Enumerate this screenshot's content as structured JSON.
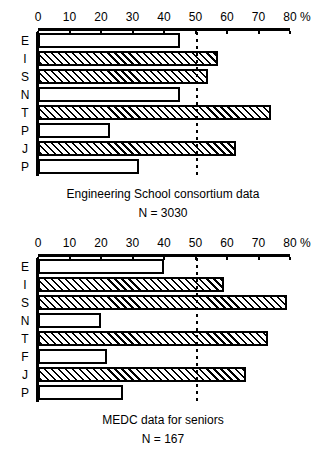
{
  "chart_data": [
    {
      "type": "bar",
      "orientation": "horizontal",
      "title": "Engineering School consortium data",
      "subtitle": "N = 3030",
      "xlabel": "%",
      "ylabel": "",
      "xlim": [
        0,
        80
      ],
      "xticks": [
        0,
        10,
        20,
        30,
        40,
        50,
        60,
        70,
        80
      ],
      "xtick_labels": [
        "0",
        "10",
        "20",
        "30",
        "40",
        "50",
        "60",
        "70",
        "80"
      ],
      "unit_suffix": "%",
      "grid": false,
      "reference_line": 50,
      "legend": "none",
      "categories": [
        "E",
        "I",
        "S",
        "N",
        "T",
        "P",
        "J",
        "P"
      ],
      "values": [
        45,
        57,
        54,
        45,
        74,
        23,
        63,
        32
      ],
      "fills": [
        "plain",
        "hatched",
        "hatched",
        "plain",
        "hatched",
        "plain",
        "hatched",
        "plain"
      ]
    },
    {
      "type": "bar",
      "orientation": "horizontal",
      "title": "MEDC data for seniors",
      "subtitle": "N = 167",
      "xlabel": "%",
      "ylabel": "",
      "xlim": [
        0,
        80
      ],
      "xticks": [
        0,
        10,
        20,
        30,
        40,
        50,
        60,
        70,
        80
      ],
      "xtick_labels": [
        "0",
        "10",
        "20",
        "30",
        "40",
        "50",
        "60",
        "70",
        "80"
      ],
      "unit_suffix": "%",
      "grid": false,
      "reference_line": 50,
      "legend": "none",
      "categories": [
        "E",
        "I",
        "S",
        "N",
        "T",
        "F",
        "J",
        "P"
      ],
      "values": [
        40,
        59,
        79,
        20,
        73,
        22,
        66,
        27
      ],
      "fills": [
        "plain",
        "hatched",
        "hatched",
        "plain",
        "hatched",
        "plain",
        "hatched",
        "plain"
      ]
    }
  ],
  "charts": [
    {
      "id": "top",
      "caption_line1": "Engineering School consortium data",
      "caption_line2": "N = 3030",
      "ticks": [
        "0",
        "10",
        "20",
        "30",
        "40",
        "50",
        "60",
        "70",
        "80"
      ],
      "percent_symbol": "%",
      "rows": [
        {
          "label": "E",
          "value": 45,
          "fill": "plain"
        },
        {
          "label": "I",
          "value": 57,
          "fill": "hatched"
        },
        {
          "label": "S",
          "value": 54,
          "fill": "hatched"
        },
        {
          "label": "N",
          "value": 45,
          "fill": "plain"
        },
        {
          "label": "T",
          "value": 74,
          "fill": "hatched"
        },
        {
          "label": "P",
          "value": 23,
          "fill": "plain"
        },
        {
          "label": "J",
          "value": 63,
          "fill": "hatched"
        },
        {
          "label": "P",
          "value": 32,
          "fill": "plain"
        }
      ]
    },
    {
      "id": "bottom",
      "caption_line1": "MEDC data for seniors",
      "caption_line2": "N = 167",
      "ticks": [
        "0",
        "10",
        "20",
        "30",
        "40",
        "50",
        "60",
        "70",
        "80"
      ],
      "percent_symbol": "%",
      "rows": [
        {
          "label": "E",
          "value": 40,
          "fill": "plain"
        },
        {
          "label": "I",
          "value": 59,
          "fill": "hatched"
        },
        {
          "label": "S",
          "value": 79,
          "fill": "hatched"
        },
        {
          "label": "N",
          "value": 20,
          "fill": "plain"
        },
        {
          "label": "T",
          "value": 73,
          "fill": "hatched"
        },
        {
          "label": "F",
          "value": 22,
          "fill": "plain"
        },
        {
          "label": "J",
          "value": 66,
          "fill": "hatched"
        },
        {
          "label": "P",
          "value": 27,
          "fill": "plain"
        }
      ]
    }
  ],
  "geometry": {
    "x_zero_px": 38,
    "x_max_px": 290,
    "px_per_percent": 3.15,
    "row_height_px": 18,
    "plot_height_px": 144
  },
  "colors": {
    "ink": "#000000",
    "paper": "#ffffff"
  }
}
